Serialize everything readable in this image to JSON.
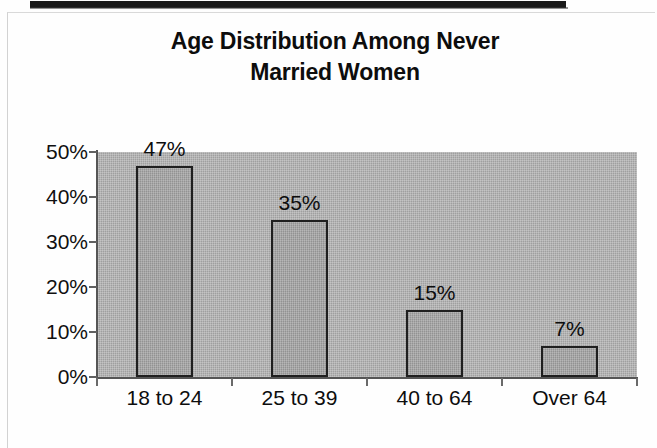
{
  "page": {
    "background_color": "#fefefe",
    "top_rule_color": "#1a1a1a",
    "frame_color": "#d2d2d2"
  },
  "chart_data": {
    "type": "bar",
    "title": "Age Distribution Among Never Married Women",
    "title_lines": [
      "Age Distribution Among Never",
      "Married Women"
    ],
    "categories": [
      "18 to 24",
      "25 to 39",
      "40 to 64",
      "Over 64"
    ],
    "values": [
      47,
      35,
      15,
      7
    ],
    "value_labels": [
      "47%",
      "35%",
      "15%",
      "7%"
    ],
    "xlabel": "",
    "ylabel": "",
    "ylim": [
      0,
      50
    ],
    "ytick_values": [
      0,
      10,
      20,
      30,
      40,
      50
    ],
    "ytick_labels": [
      "0%",
      "10%",
      "20%",
      "30%",
      "40%",
      "50%"
    ],
    "grid": false,
    "legend": false,
    "legend_position": "none",
    "plot_background_color": "#ababab",
    "bar_fill_color": "#a3a3a3",
    "bar_border_color": "#1f1f1f",
    "axis_color": "#555555",
    "text_color": "#0d0d0d"
  }
}
